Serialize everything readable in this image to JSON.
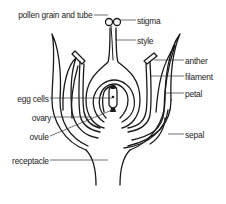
{
  "diagram": {
    "labels": {
      "pollen": "pollen grain and tube",
      "stigma": "stigma",
      "style": "style",
      "anther": "anther",
      "filament": "filament",
      "petal": "petal",
      "egg_cells": "egg cells",
      "ovary": "ovary",
      "ovule": "ovule",
      "sepal": "sepal",
      "receptacle": "receptacle"
    },
    "colors": {
      "stroke": "#1a1a1a",
      "leader": "#333333",
      "background": "#ffffff"
    }
  }
}
